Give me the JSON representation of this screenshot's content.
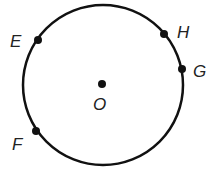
{
  "diagram": {
    "type": "circle",
    "center": {
      "label": "O",
      "x": 102,
      "y": 84
    },
    "circle": {
      "cx": 103,
      "cy": 85,
      "r": 80,
      "stroke": "#111111"
    },
    "points": [
      {
        "label": "E",
        "x": 38,
        "y": 40,
        "lx": 10,
        "ly": 47
      },
      {
        "label": "H",
        "x": 164,
        "y": 34,
        "lx": 177,
        "ly": 38
      },
      {
        "label": "G",
        "x": 182,
        "y": 69,
        "lx": 193,
        "ly": 77
      },
      {
        "label": "F",
        "x": 36,
        "y": 131,
        "lx": 12,
        "ly": 150
      }
    ],
    "center_label_pos": {
      "lx": 93,
      "ly": 110
    }
  }
}
